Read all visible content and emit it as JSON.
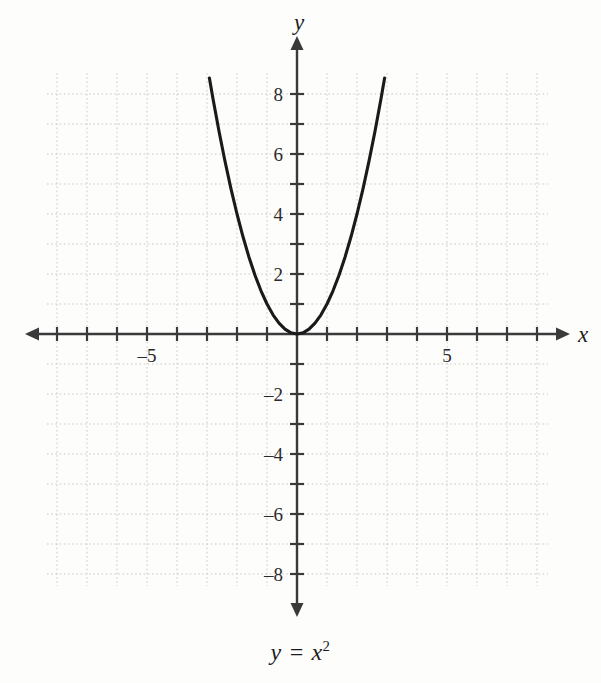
{
  "chart_data": {
    "type": "line",
    "title": "",
    "subtitle": "",
    "caption": "y = x2",
    "caption_base": "y = x",
    "caption_exponent": "2",
    "equation": "y = x^2",
    "function": "y = x*x",
    "xlabel": "x",
    "ylabel": "y",
    "xlim": [
      -8.33,
      8.37
    ],
    "ylim": [
      -8.4,
      8.7
    ],
    "x_tick_step": 1,
    "y_tick_step": 1,
    "x_tick_values": [
      -8,
      -7,
      -6,
      -5,
      -4,
      -3,
      -2,
      -1,
      1,
      2,
      3,
      4,
      5,
      6,
      7,
      8
    ],
    "y_tick_values": [
      -8,
      -7,
      -6,
      -5,
      -4,
      -3,
      -2,
      -1,
      1,
      2,
      3,
      4,
      5,
      6,
      7,
      8
    ],
    "x_tick_labels": [
      {
        "value": -5,
        "text": "–5"
      },
      {
        "value": 5,
        "text": "5"
      }
    ],
    "y_tick_labels": [
      {
        "value": 8,
        "text": "8"
      },
      {
        "value": 6,
        "text": "6"
      },
      {
        "value": 4,
        "text": "4"
      },
      {
        "value": 2,
        "text": "2"
      },
      {
        "value": -2,
        "text": "–2"
      },
      {
        "value": -4,
        "text": "–4"
      },
      {
        "value": -6,
        "text": "–6"
      },
      {
        "value": -8,
        "text": "–8"
      }
    ],
    "grid": true,
    "grid_style": "dotted",
    "grid_color": "#c9c9c9",
    "legend": false,
    "legend_position": "none",
    "axis_color": "#3a3a3a",
    "curve_color": "#1a1a1a",
    "background_color": "#fdfdfc",
    "series": [
      {
        "name": "y = x2",
        "color": "#1a1a1a",
        "points": [
          {
            "x": -2.92,
            "y": 8.53
          },
          {
            "x": -2.8,
            "y": 7.84
          },
          {
            "x": -2.6,
            "y": 6.76
          },
          {
            "x": -2.4,
            "y": 5.76
          },
          {
            "x": -2.2,
            "y": 4.84
          },
          {
            "x": -2.0,
            "y": 4.0
          },
          {
            "x": -1.8,
            "y": 3.24
          },
          {
            "x": -1.6,
            "y": 2.56
          },
          {
            "x": -1.4,
            "y": 1.96
          },
          {
            "x": -1.2,
            "y": 1.44
          },
          {
            "x": -1.0,
            "y": 1.0
          },
          {
            "x": -0.8,
            "y": 0.64
          },
          {
            "x": -0.6,
            "y": 0.36
          },
          {
            "x": -0.4,
            "y": 0.16
          },
          {
            "x": -0.2,
            "y": 0.04
          },
          {
            "x": 0.0,
            "y": 0.0
          },
          {
            "x": 0.2,
            "y": 0.04
          },
          {
            "x": 0.4,
            "y": 0.16
          },
          {
            "x": 0.6,
            "y": 0.36
          },
          {
            "x": 0.8,
            "y": 0.64
          },
          {
            "x": 1.0,
            "y": 1.0
          },
          {
            "x": 1.2,
            "y": 1.44
          },
          {
            "x": 1.4,
            "y": 1.96
          },
          {
            "x": 1.6,
            "y": 2.56
          },
          {
            "x": 1.8,
            "y": 3.24
          },
          {
            "x": 2.0,
            "y": 4.0
          },
          {
            "x": 2.2,
            "y": 4.84
          },
          {
            "x": 2.4,
            "y": 5.76
          },
          {
            "x": 2.6,
            "y": 6.76
          },
          {
            "x": 2.8,
            "y": 7.84
          },
          {
            "x": 2.92,
            "y": 8.53
          }
        ]
      }
    ],
    "vertex": {
      "x": 0,
      "y": 0
    },
    "annotations": []
  },
  "geometry": {
    "origin_x": 297,
    "origin_y": 334,
    "unit_px": 30,
    "grid_left": 47,
    "grid_right": 548,
    "grid_top": 73,
    "grid_bottom": 586,
    "x_axis_arrow_left": 25,
    "x_axis_arrow_right": 570,
    "y_axis_arrow_top": 36,
    "y_axis_arrow_bottom": 617,
    "tick_half_len": 7
  }
}
